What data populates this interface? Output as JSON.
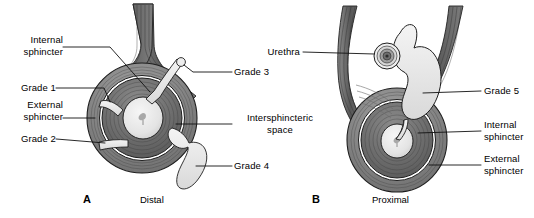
{
  "figure": {
    "width": 534,
    "height": 218,
    "background": "#ffffff",
    "ink": "#000000"
  },
  "palette": {
    "outline": "#1a1a1a",
    "muscle_dark": "#5e5e5e",
    "muscle_mid": "#7d7d7d",
    "muscle_light": "#9a9a9a",
    "internal_sphincter": "#6b6b6b",
    "external_sphincter": "#8a8a8a",
    "lumen": "#e3e3e3",
    "tract_fill": "#ebebeb",
    "intersphincteric_white": "#ffffff",
    "leader_line": "#111111"
  },
  "panels": [
    {
      "id": "A",
      "letter": "A",
      "caption": "Distal",
      "labels": [
        {
          "id": "internal-sphincter",
          "text": "Internal\nsphincter",
          "side": "left"
        },
        {
          "id": "grade-1",
          "text": "Grade 1",
          "side": "left"
        },
        {
          "id": "external-sphincter",
          "text": "External\nsphincter",
          "side": "left"
        },
        {
          "id": "grade-2",
          "text": "Grade 2",
          "side": "left"
        },
        {
          "id": "grade-3",
          "text": "Grade 3",
          "side": "right"
        },
        {
          "id": "intersphincteric-space",
          "text": "Intersphincteric\nspace",
          "side": "right"
        },
        {
          "id": "grade-4",
          "text": "Grade 4",
          "side": "right"
        }
      ]
    },
    {
      "id": "B",
      "letter": "B",
      "caption": "Proximal",
      "labels": [
        {
          "id": "urethra",
          "text": "Urethra",
          "side": "left"
        },
        {
          "id": "grade-5",
          "text": "Grade 5",
          "side": "right"
        },
        {
          "id": "internal-sphincter",
          "text": "Internal\nsphincter",
          "side": "right"
        },
        {
          "id": "external-sphincter",
          "text": "External\nsphincter",
          "side": "right"
        }
      ]
    }
  ],
  "labels": {
    "a_internal_sphincter": "Internal\nsphincter",
    "a_grade_1": "Grade 1",
    "a_external_sphincter": "External\nsphincter",
    "a_grade_2": "Grade 2",
    "a_grade_3": "Grade 3",
    "a_intersphincteric_space": "Intersphincteric\nspace",
    "a_grade_4": "Grade 4",
    "a_letter": "A",
    "a_caption": "Distal",
    "b_urethra": "Urethra",
    "b_grade_5": "Grade 5",
    "b_internal_sphincter": "Internal\nsphincter",
    "b_external_sphincter": "External\nsphincter",
    "b_letter": "B",
    "b_caption": "Proximal"
  }
}
